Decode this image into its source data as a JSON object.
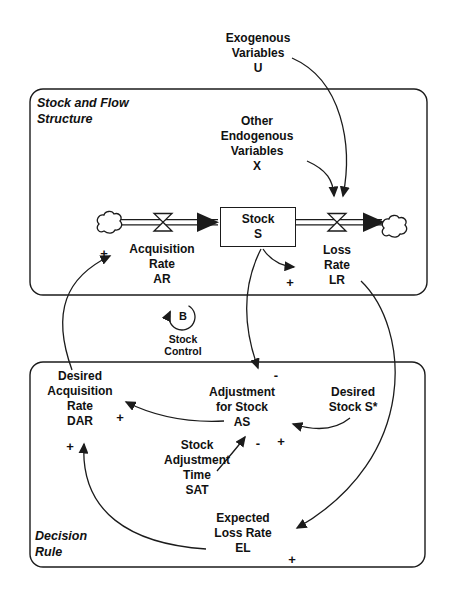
{
  "frames": {
    "stock_flow": {
      "title": [
        "Stock and Flow",
        "Structure"
      ]
    },
    "decision": {
      "title": [
        "Decision",
        "Rule"
      ]
    }
  },
  "nodes": {
    "exogenous": [
      "Exogenous",
      "Variables",
      "U"
    ],
    "other_endogenous": [
      "Other",
      "Endogenous",
      "Variables",
      "X"
    ],
    "stock": [
      "Stock",
      "S"
    ],
    "acquisition_rate": [
      "Acquisition",
      "Rate",
      "AR"
    ],
    "loss_rate": [
      "Loss",
      "Rate",
      "LR"
    ],
    "desired_acquisition_rate": [
      "Desired",
      "Acquisition",
      "Rate",
      "DAR"
    ],
    "adjustment_for_stock": [
      "Adjustment",
      "for Stock",
      "AS"
    ],
    "desired_stock": [
      "Desired",
      "Stock S*"
    ],
    "stock_adjustment_time": [
      "Stock",
      "Adjustment",
      "Time",
      "SAT"
    ],
    "expected_loss_rate": [
      "Expected",
      "Loss Rate",
      "EL"
    ]
  },
  "loop": {
    "label": "B",
    "caption": [
      "Stock",
      "Control"
    ]
  },
  "signs": {
    "acquisition_rate": "+",
    "loss_rate": "+",
    "adjustment_from_stock": "-",
    "dar_from_adjustment": "+",
    "adjustment_from_desired_stock": "+",
    "adjustment_from_sat": "-",
    "dar_from_expected_loss": "+",
    "expected_loss_from_loss_rate": "+"
  },
  "colors": {
    "line": "#1b1b1b",
    "text": "#111111",
    "background": "#ffffff"
  }
}
